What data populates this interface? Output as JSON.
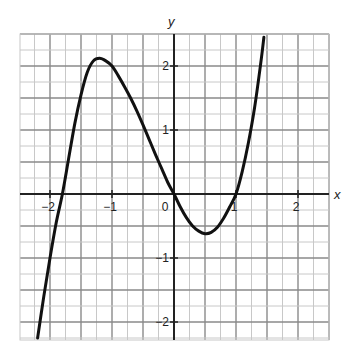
{
  "chart_data": {
    "type": "line",
    "title": "",
    "xlabel": "x",
    "ylabel": "y",
    "xlim": [
      -2.5,
      2.5
    ],
    "ylim": [
      -2.35,
      2.5
    ],
    "grid": true,
    "minor_grid_step": 0.25,
    "x_ticks": [
      -2,
      -1,
      0,
      1,
      2
    ],
    "x_tick_labels": [
      "−2",
      "−1",
      "0",
      "1",
      "2"
    ],
    "y_ticks": [
      -2,
      -1,
      1,
      2
    ],
    "y_tick_labels": [
      "−2",
      "−1",
      "1",
      "2"
    ],
    "origin_label": "0",
    "series": [
      {
        "name": "cubic curve",
        "color": "#111111",
        "x": [
          -2.2,
          -2.1,
          -2.0,
          -1.9,
          -1.8,
          -1.7,
          -1.6,
          -1.5,
          -1.4,
          -1.3,
          -1.2,
          -1.1,
          -1.0,
          -0.9,
          -0.8,
          -0.7,
          -0.6,
          -0.5,
          -0.4,
          -0.3,
          -0.2,
          -0.1,
          0.0,
          0.1,
          0.2,
          0.3,
          0.4,
          0.5,
          0.6,
          0.7,
          0.8,
          0.9,
          1.0,
          1.1,
          1.2,
          1.3,
          1.4,
          1.45
        ],
        "y": [
          -2.25,
          -1.6,
          -1.0,
          -0.45,
          0.0,
          0.55,
          1.1,
          1.55,
          1.9,
          2.08,
          2.12,
          2.08,
          2.0,
          1.85,
          1.68,
          1.5,
          1.3,
          1.08,
          0.85,
          0.62,
          0.4,
          0.18,
          0.0,
          -0.2,
          -0.37,
          -0.5,
          -0.58,
          -0.62,
          -0.6,
          -0.52,
          -0.38,
          -0.2,
          0.0,
          0.35,
          0.8,
          1.35,
          2.05,
          2.45
        ]
      }
    ],
    "key_points": {
      "roots": [
        -1.8,
        0,
        1
      ],
      "local_max": [
        -1.2,
        2.1
      ],
      "local_min": [
        0.55,
        -0.6
      ]
    }
  },
  "colors": {
    "minor_grid": "#c8c8c8",
    "major_grid": "#8a8a8a",
    "axis": "#222222",
    "curve": "#111111"
  }
}
